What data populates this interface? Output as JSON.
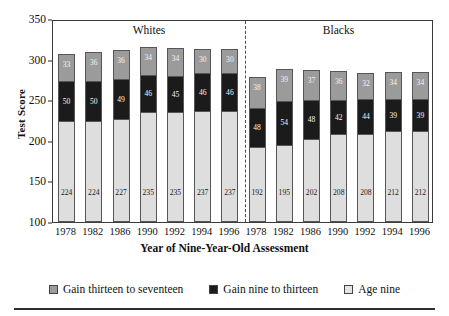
{
  "chart_data": {
    "type": "bar",
    "stacked": true,
    "title": "",
    "xlabel": "Year of Nine-Year-Old Assessment",
    "ylabel": "Test Score",
    "ylim": [
      100,
      350
    ],
    "yticks": [
      100,
      150,
      200,
      250,
      300,
      350
    ],
    "grid": false,
    "legend_position": "bottom",
    "groups": [
      "Whites",
      "Blacks"
    ],
    "categories": [
      "1978",
      "1982",
      "1986",
      "1990",
      "1992",
      "1994",
      "1996",
      "1978",
      "1982",
      "1986",
      "1990",
      "1992",
      "1994",
      "1996"
    ],
    "series": [
      {
        "name": "Age nine",
        "color": "#dedede",
        "values": [
          224,
          224,
          227,
          235,
          235,
          237,
          237,
          192,
          195,
          202,
          208,
          208,
          212,
          212
        ]
      },
      {
        "name": "Gain nine to thirteen",
        "color": "#1b1b1b",
        "values": [
          50,
          50,
          49,
          46,
          45,
          46,
          46,
          48,
          54,
          48,
          42,
          44,
          39,
          39
        ]
      },
      {
        "name": "Gain thirteen to seventeen",
        "color": "#9b9b9b",
        "values": [
          33,
          36,
          36,
          34,
          34,
          30,
          30,
          38,
          39,
          37,
          36,
          32,
          34,
          34
        ]
      }
    ],
    "totals": [
      307,
      310,
      312,
      315,
      314,
      313,
      313,
      278,
      288,
      287,
      286,
      284,
      285,
      285
    ]
  },
  "axes": {
    "y_label": "Test Score",
    "y_ticks": [
      "350",
      "300",
      "250",
      "200",
      "150",
      "100"
    ],
    "x_label": "Year of Nine-Year-Old Assessment",
    "x_ticks": [
      "1978",
      "1982",
      "1986",
      "1990",
      "1992",
      "1994",
      "1996",
      "1978",
      "1982",
      "1986",
      "1990",
      "1992",
      "1994",
      "1996"
    ]
  },
  "group_headers": [
    {
      "label": "Whites"
    },
    {
      "label": "Blacks"
    }
  ],
  "legend": {
    "items": [
      {
        "label": "Gain thirteen to seventeen",
        "color": "#9b9b9b",
        "swatch": "square-gray"
      },
      {
        "label": "Gain nine to thirteen",
        "color": "#1b1b1b",
        "swatch": "square-black"
      },
      {
        "label": "Age nine",
        "color": "#e4e4e4",
        "swatch": "square-lightgray"
      }
    ]
  },
  "bar_labels": {
    "top": [
      "33",
      "36",
      "36",
      "34",
      "34",
      "30",
      "30",
      "38",
      "39",
      "37",
      "36",
      "32",
      "34",
      "34"
    ],
    "middle": [
      "50",
      "50",
      "49",
      "46",
      "45",
      "46",
      "46",
      "48",
      "54",
      "48",
      "42",
      "44",
      "39",
      "39"
    ],
    "bottom": [
      "224",
      "224",
      "227",
      "235",
      "235",
      "237",
      "237",
      "192",
      "195",
      "202",
      "208",
      "208",
      "212",
      "212"
    ]
  }
}
